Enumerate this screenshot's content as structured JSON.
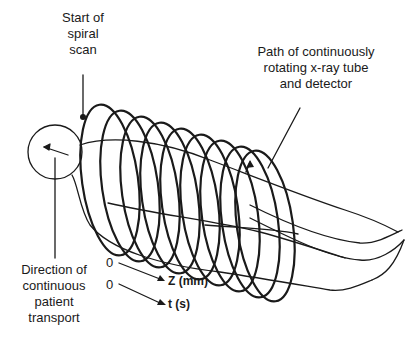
{
  "diagram": {
    "labels": {
      "start": [
        "Start of",
        "spiral",
        "scan"
      ],
      "path": [
        "Path of continuously",
        "rotating x-ray tube",
        "and detector"
      ],
      "direction": [
        "Direction of",
        "continuous",
        "patient",
        "transport"
      ]
    },
    "axes": [
      {
        "origin": "0",
        "label": "Z (mm)"
      },
      {
        "origin": "0",
        "label": "t (s)"
      }
    ],
    "colors": {
      "line": "#1a1a1a",
      "background": "#ffffff"
    }
  }
}
